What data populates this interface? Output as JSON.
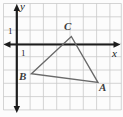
{
  "figure": {
    "background": "#fcfcfc",
    "grid_color": "#c9c9c9",
    "axis_color": "#1c1c1c",
    "triangle_color": "#6a6a6a",
    "vertex_label_color": "#3d3d3d"
  },
  "axes": {
    "x_label": "x",
    "y_label": "y",
    "x_tick_label": "1",
    "y_tick_label": "1"
  },
  "chart_data": {
    "type": "scatter",
    "title": "",
    "xlabel": "x",
    "ylabel": "y",
    "xlim": [
      -1,
      7.9
    ],
    "ylim": [
      -4.9,
      3.1
    ],
    "grid": true,
    "shape": "triangle",
    "closed": true,
    "points": [
      {
        "label": "B",
        "x": 1.1,
        "y": -2.2
      },
      {
        "label": "C",
        "x": 4.1,
        "y": 0.6
      },
      {
        "label": "A",
        "x": 6.1,
        "y": -2.85
      }
    ]
  }
}
